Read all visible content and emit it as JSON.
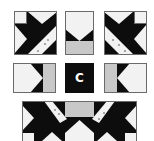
{
  "figure": {
    "center_label": "C",
    "colors": {
      "dark": "#0d0d0d",
      "light": "#f2f2f2",
      "medium": "#c8c8c8",
      "outline": "#6a6a6a"
    },
    "blocks": [
      {
        "id": "top-left",
        "type": "star-corner"
      },
      {
        "id": "top-middle",
        "type": "flying-goose-top"
      },
      {
        "id": "top-right",
        "type": "star-corner-mirrored"
      },
      {
        "id": "middle-left",
        "type": "flying-goose-left"
      },
      {
        "id": "center",
        "type": "center-square"
      },
      {
        "id": "middle-right",
        "type": "flying-goose-right"
      },
      {
        "id": "bottom-strip",
        "type": "assembled-row"
      }
    ]
  }
}
